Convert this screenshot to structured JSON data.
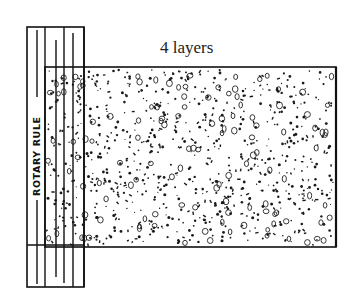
{
  "figure": {
    "caption": "4 layers",
    "tool_label": "ROTARY RULE",
    "elements": {
      "rotary_rule": {
        "x": 27,
        "y": 27,
        "width": 57,
        "height": 260
      },
      "material_block": {
        "x": 45,
        "y": 67,
        "width": 291,
        "height": 180
      },
      "layers": 4
    },
    "colors": {
      "ink": "#111111",
      "background": "#ffffff"
    }
  }
}
